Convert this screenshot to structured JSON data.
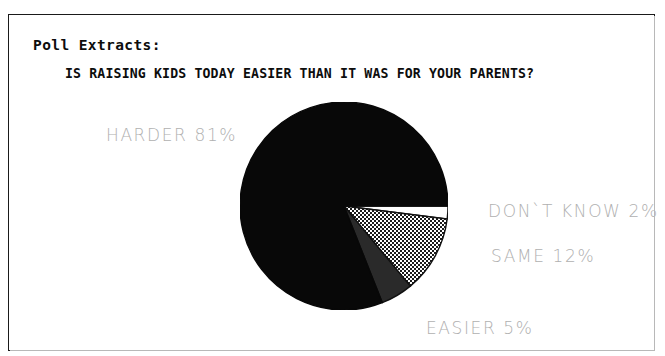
{
  "frame": {
    "border_color": "#1a1a1a",
    "background": "#ffffff"
  },
  "header": {
    "section_label": "Poll Extracts:",
    "question": "IS RAISING KIDS TODAY EASIER THAN IT WAS FOR YOUR PARENTS?"
  },
  "labels": {
    "harder": "HARDER 81%",
    "dont_know": "DON`T KNOW 2%",
    "same": "SAME 12%",
    "easier": "EASIER 5%",
    "color": "#b0b0b0"
  },
  "chart_data": {
    "type": "pie",
    "title": "IS RAISING KIDS TODAY EASIER THAN IT WAS FOR YOUR PARENTS?",
    "xlabel": "",
    "ylabel": "",
    "legend_position": "callout-labels",
    "grid": false,
    "unit": "%",
    "start_angle_deg": 0,
    "direction": "clockwise",
    "categories": [
      "DON`T KNOW",
      "SAME",
      "EASIER",
      "HARDER"
    ],
    "values": [
      2,
      12,
      5,
      81
    ],
    "slices": [
      {
        "name": "DON`T KNOW",
        "value": 2,
        "label": "DON`T KNOW 2%",
        "fill": "#ffffff",
        "stroke": "#111111",
        "pattern": "solid-white"
      },
      {
        "name": "SAME",
        "value": 12,
        "label": "SAME 12%",
        "fill": "#8c8c8c",
        "stroke": "#111111",
        "pattern": "checkerboard-dither-50"
      },
      {
        "name": "EASIER",
        "value": 5,
        "label": "EASIER 5%",
        "fill": "#2a2a2a",
        "stroke": "#111111",
        "pattern": "solid-dark-gray"
      },
      {
        "name": "HARDER",
        "value": 81,
        "label": "HARDER 81%",
        "fill": "#080808",
        "stroke": "#080808",
        "pattern": "solid-black"
      }
    ],
    "center": {
      "x": 335,
      "y": 191
    },
    "radius": 104
  }
}
